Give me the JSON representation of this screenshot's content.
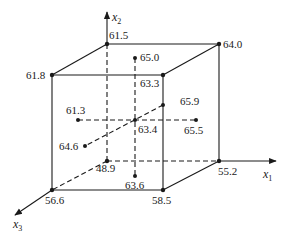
{
  "diagram": {
    "type": "cube-design-points",
    "axes": [
      {
        "id": "x1",
        "label": "x",
        "subscript": "1"
      },
      {
        "id": "x2",
        "label": "x",
        "subscript": "2"
      },
      {
        "id": "x3",
        "label": "x",
        "subscript": "3"
      }
    ],
    "corner_points": [
      {
        "name": "back-top-left",
        "value": "61.5"
      },
      {
        "name": "back-top-right",
        "value": "64.0"
      },
      {
        "name": "front-top-left",
        "value": "61.8"
      },
      {
        "name": "front-top-right",
        "value": "63.3"
      },
      {
        "name": "back-bottom-left",
        "value": "48.9"
      },
      {
        "name": "back-bottom-right",
        "value": "55.2"
      },
      {
        "name": "front-bottom-left",
        "value": "56.6"
      },
      {
        "name": "front-bottom-right",
        "value": "58.5"
      }
    ],
    "axial_points": [
      {
        "name": "top",
        "value": "65.0"
      },
      {
        "name": "bottom",
        "value": "63.6"
      },
      {
        "name": "left",
        "value": "61.3"
      },
      {
        "name": "right",
        "value": "65.5"
      },
      {
        "name": "back",
        "value": "65.9"
      },
      {
        "name": "front",
        "value": "64.6"
      }
    ],
    "center_point": {
      "name": "center",
      "value": "63.4"
    }
  }
}
